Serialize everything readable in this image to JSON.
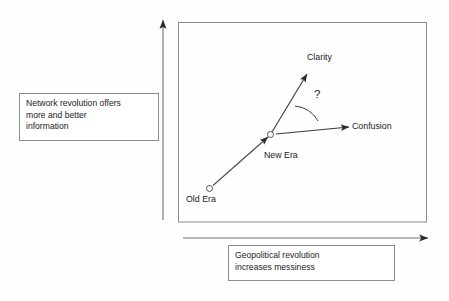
{
  "diagram": {
    "axes": {
      "y_axis": {
        "icon": "up-arrow-icon",
        "callout": "Network revolution offers\nmore and better\ninformation"
      },
      "x_axis": {
        "icon": "right-arrow-icon",
        "callout": "Geopolitical revolution\nincreases messiness"
      }
    },
    "nodes": [
      {
        "id": "old-era",
        "label": "Old Era",
        "x": 210,
        "y": 188
      },
      {
        "id": "new-era",
        "label": "New Era",
        "x": 270,
        "y": 135
      }
    ],
    "outcomes": [
      {
        "id": "clarity",
        "label": "Clarity"
      },
      {
        "id": "confusion",
        "label": "Confusion"
      }
    ],
    "uncertainty_marker": "?",
    "colors": {
      "stroke": "#3a3a3a",
      "frame": "#8c8c8c",
      "box_border": "#8c8c8c",
      "background": "#ffffff",
      "text": "#1a1a1a"
    }
  }
}
